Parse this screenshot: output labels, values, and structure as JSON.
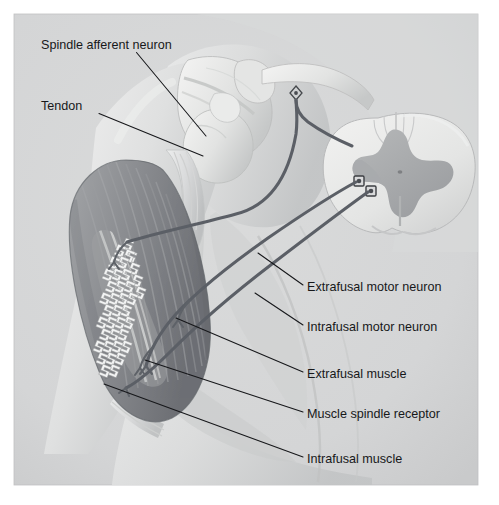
{
  "figure": {
    "panel_color": "#d4d5d6",
    "page_color": "#ffffff",
    "ink_color": "#17181a",
    "nerve_color": "#5b5f66"
  },
  "labels": {
    "left": [
      {
        "id": "spindle-afferent-neuron",
        "text": "Spindle afferent neuron",
        "text_x": 41,
        "text_y": 46,
        "leader": "M136.5,52.5 L206,136"
      },
      {
        "id": "tendon",
        "text": "Tendon",
        "text_x": 41,
        "text_y": 107,
        "leader": "M99,113.5 L203,156"
      }
    ],
    "right": [
      {
        "id": "extrafusal-motor-neuron",
        "text": "Extrafusal motor neuron",
        "text_x": 307,
        "text_y": 288,
        "leader": "M303,285 L258,253"
      },
      {
        "id": "intrafusal-motor-neuron",
        "text": "Intrafusal motor neuron",
        "text_x": 307,
        "text_y": 328,
        "leader": "M303,325 L255,293"
      },
      {
        "id": "extrafusal-muscle",
        "text": "Extrafusal muscle",
        "text_x": 307,
        "text_y": 375,
        "leader": "M303,372 L176,318"
      },
      {
        "id": "muscle-spindle-receptor",
        "text": "Muscle spindle receptor",
        "text_x": 307,
        "text_y": 415,
        "leader": "M303,412 L145,360"
      },
      {
        "id": "intrafusal-muscle",
        "text": "Intrafusal muscle",
        "text_x": 307,
        "text_y": 460,
        "leader": "M303,457 L104,384"
      }
    ]
  },
  "anatomy": {
    "panel": {
      "x": 14,
      "y": 14,
      "width": 464,
      "height": 471
    },
    "structures": [
      {
        "id": "torso-shoulder",
        "name": "Torso and shoulder silhouette"
      },
      {
        "id": "scapula",
        "name": "Scapula"
      },
      {
        "id": "clavicle",
        "name": "Clavicle"
      },
      {
        "id": "humerus",
        "name": "Humerus"
      },
      {
        "id": "tendon-band",
        "name": "Tendon of biceps"
      },
      {
        "id": "extrafusal-muscle-belly",
        "name": "Extrafusal muscle belly"
      },
      {
        "id": "intrafusal-fibers",
        "name": "Intrafusal muscle fibers"
      },
      {
        "id": "annulospiral-ending",
        "name": "Annulospiral sensory ending"
      },
      {
        "id": "spinal-cord",
        "name": "Spinal cord cross-section"
      },
      {
        "id": "gray-matter",
        "name": "Gray matter butterfly"
      },
      {
        "id": "dorsal-root-ganglion",
        "name": "Dorsal root ganglion"
      },
      {
        "id": "alpha-motor-cell-body",
        "name": "Alpha motor neuron cell body"
      },
      {
        "id": "gamma-motor-cell-body",
        "name": "Gamma motor neuron cell body"
      }
    ]
  }
}
